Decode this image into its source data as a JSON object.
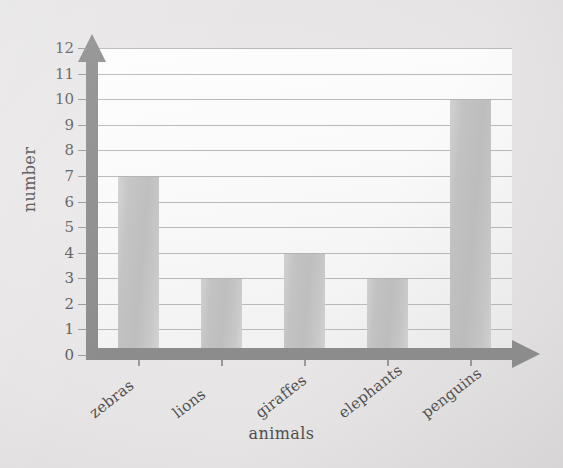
{
  "chart_data": {
    "type": "bar",
    "title": "",
    "xlabel": "animals",
    "ylabel": "number",
    "categories": [
      "zebras",
      "lions",
      "giraffes",
      "elephants",
      "penguins"
    ],
    "values": [
      7,
      3,
      4,
      3,
      10
    ],
    "ylim": [
      0,
      12
    ],
    "ytick_labels": [
      "0",
      "1",
      "2",
      "3",
      "4",
      "5",
      "6",
      "7",
      "8",
      "9",
      "10",
      "11",
      "12"
    ],
    "ytick_values": [
      0,
      1,
      2,
      3,
      4,
      5,
      6,
      7,
      8,
      9,
      10,
      11,
      12
    ],
    "grid": true,
    "grid_axis": "y",
    "legend": false,
    "series": [
      {
        "name": "number",
        "values": [
          7,
          3,
          4,
          3,
          10
        ]
      }
    ],
    "colors": {
      "bar_fill": "#c3c3c3",
      "bar_edge": "#b2b2b2",
      "axis": "#8c8c8c",
      "gridline": "#b9b9b9",
      "plot_background": "#fafafa",
      "page_background": "#e3e1e1",
      "text": "#4f4f4f"
    },
    "x_tick_label_rotation_deg": -38
  },
  "axes": {
    "y_axis_name": "y-axis-arrow",
    "x_axis_name": "x-axis-arrow"
  }
}
